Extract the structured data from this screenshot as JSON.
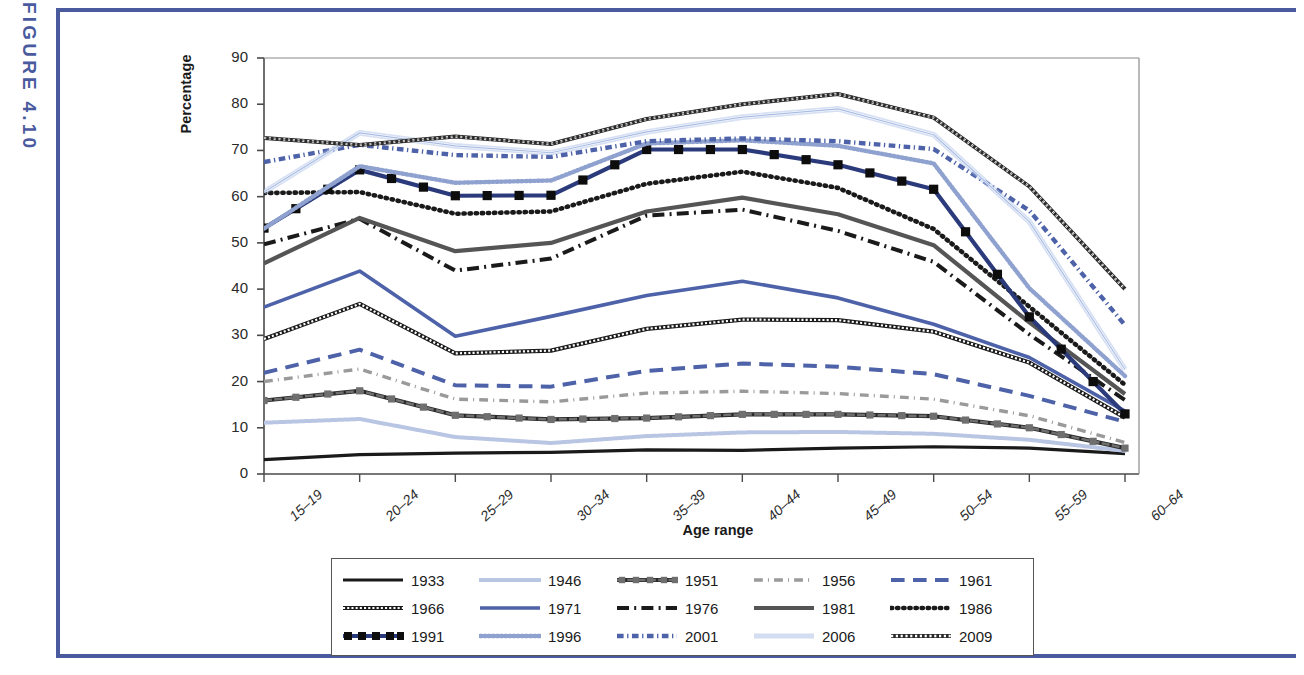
{
  "figure": {
    "label": "FIGURE 4.10",
    "accent_color": "#4a5a9e"
  },
  "chart_data": {
    "type": "line",
    "title": "",
    "xlabel": "Age range",
    "ylabel": "Percentage",
    "ylim": [
      0,
      90
    ],
    "yticks": [
      0,
      10,
      20,
      30,
      40,
      50,
      60,
      70,
      80,
      90
    ],
    "grid": false,
    "legend_position": "bottom",
    "categories": [
      "15–19",
      "20–24",
      "25–29",
      "30–34",
      "35–39",
      "40–44",
      "45–49",
      "50–54",
      "55–59",
      "60–64"
    ],
    "series": [
      {
        "name": "1933",
        "color": "#1a1a1a",
        "style": "solid",
        "width": 3.2,
        "marker": "none",
        "values": [
          3.1,
          4.2,
          4.5,
          4.7,
          5.2,
          5.1,
          5.6,
          5.9,
          5.6,
          4.4
        ]
      },
      {
        "name": "1946",
        "color": "#b8c6e4",
        "style": "dotted-fine",
        "width": 4.0,
        "marker": "none",
        "values": [
          11.1,
          11.9,
          8.0,
          6.7,
          8.2,
          9.0,
          9.1,
          8.7,
          7.4,
          5.0
        ]
      },
      {
        "name": "1951",
        "color": "#6f6f6f",
        "style": "dash-bead",
        "width": 4.2,
        "marker": "square-gray",
        "values": [
          15.9,
          18.0,
          12.7,
          11.8,
          12.1,
          12.9,
          12.9,
          12.5,
          10.0,
          5.6
        ]
      },
      {
        "name": "1956",
        "color": "#9a9a9a",
        "style": "dash-dot",
        "width": 3.4,
        "marker": "none",
        "values": [
          20.0,
          22.7,
          16.2,
          15.6,
          17.5,
          17.9,
          17.4,
          16.2,
          12.6,
          6.8
        ]
      },
      {
        "name": "1961",
        "color": "#4d62a8",
        "style": "dashed-wide",
        "width": 4.0,
        "marker": "none",
        "values": [
          21.9,
          26.9,
          19.2,
          18.9,
          22.3,
          23.9,
          23.2,
          21.6,
          16.9,
          11.3
        ]
      },
      {
        "name": "1966",
        "color": "#1a1a1a",
        "style": "bead-chain",
        "width": 4.2,
        "marker": "none",
        "values": [
          29.2,
          36.8,
          26.1,
          26.7,
          31.4,
          33.4,
          33.3,
          30.8,
          24.1,
          12.2
        ]
      },
      {
        "name": "1971",
        "color": "#4d62a8",
        "style": "solid",
        "width": 3.6,
        "marker": "none",
        "values": [
          36.1,
          43.9,
          29.8,
          34.1,
          38.6,
          41.7,
          38.1,
          32.4,
          25.2,
          13.6
        ]
      },
      {
        "name": "1976",
        "color": "#1a1a1a",
        "style": "dash-dot-heavy",
        "width": 4.0,
        "marker": "none",
        "values": [
          49.7,
          55.2,
          44.0,
          46.6,
          55.9,
          57.2,
          52.6,
          45.9,
          30.2,
          16.0
        ]
      },
      {
        "name": "1981",
        "color": "#555555",
        "style": "solid",
        "width": 4.2,
        "marker": "none",
        "values": [
          45.6,
          55.4,
          48.2,
          50.0,
          56.8,
          59.8,
          56.2,
          49.5,
          32.8,
          17.3
        ]
      },
      {
        "name": "1986",
        "color": "#1a1a1a",
        "style": "dotted-bold",
        "width": 4.6,
        "marker": "none",
        "values": [
          60.8,
          61.0,
          56.3,
          56.8,
          62.8,
          65.4,
          61.9,
          53.0,
          36.2,
          19.3
        ]
      },
      {
        "name": "1991",
        "color": "#2b3a7a",
        "style": "solid",
        "width": 4.2,
        "marker": "square-black",
        "values": [
          53.2,
          65.8,
          60.2,
          60.3,
          70.2,
          70.2,
          66.9,
          61.6,
          34.0,
          13.0
        ]
      },
      {
        "name": "1996",
        "color": "#8fa2cf",
        "style": "dotted-med",
        "width": 4.4,
        "marker": "none",
        "values": [
          53.1,
          66.6,
          63.0,
          63.5,
          71.5,
          72.2,
          71.0,
          67.2,
          40.2,
          21.2
        ]
      },
      {
        "name": "2001",
        "color": "#4d62a8",
        "style": "dash-dot-dense",
        "width": 4.4,
        "marker": "none",
        "values": [
          67.5,
          71.2,
          69.0,
          68.6,
          72.0,
          72.6,
          72.0,
          70.3,
          57.0,
          32.2
        ]
      },
      {
        "name": "2006",
        "color": "#a9bde4",
        "style": "thin-double",
        "width": 2.2,
        "marker": "none",
        "values": [
          61.0,
          73.8,
          71.0,
          69.5,
          74.0,
          77.2,
          79.0,
          73.4,
          54.6,
          22.6
        ]
      },
      {
        "name": "2009",
        "color": "#2a2a2a",
        "style": "crosshatch",
        "width": 4.0,
        "marker": "none",
        "values": [
          72.7,
          71.2,
          73.0,
          71.4,
          76.8,
          80.0,
          82.2,
          77.1,
          62.2,
          40.0
        ]
      }
    ]
  }
}
